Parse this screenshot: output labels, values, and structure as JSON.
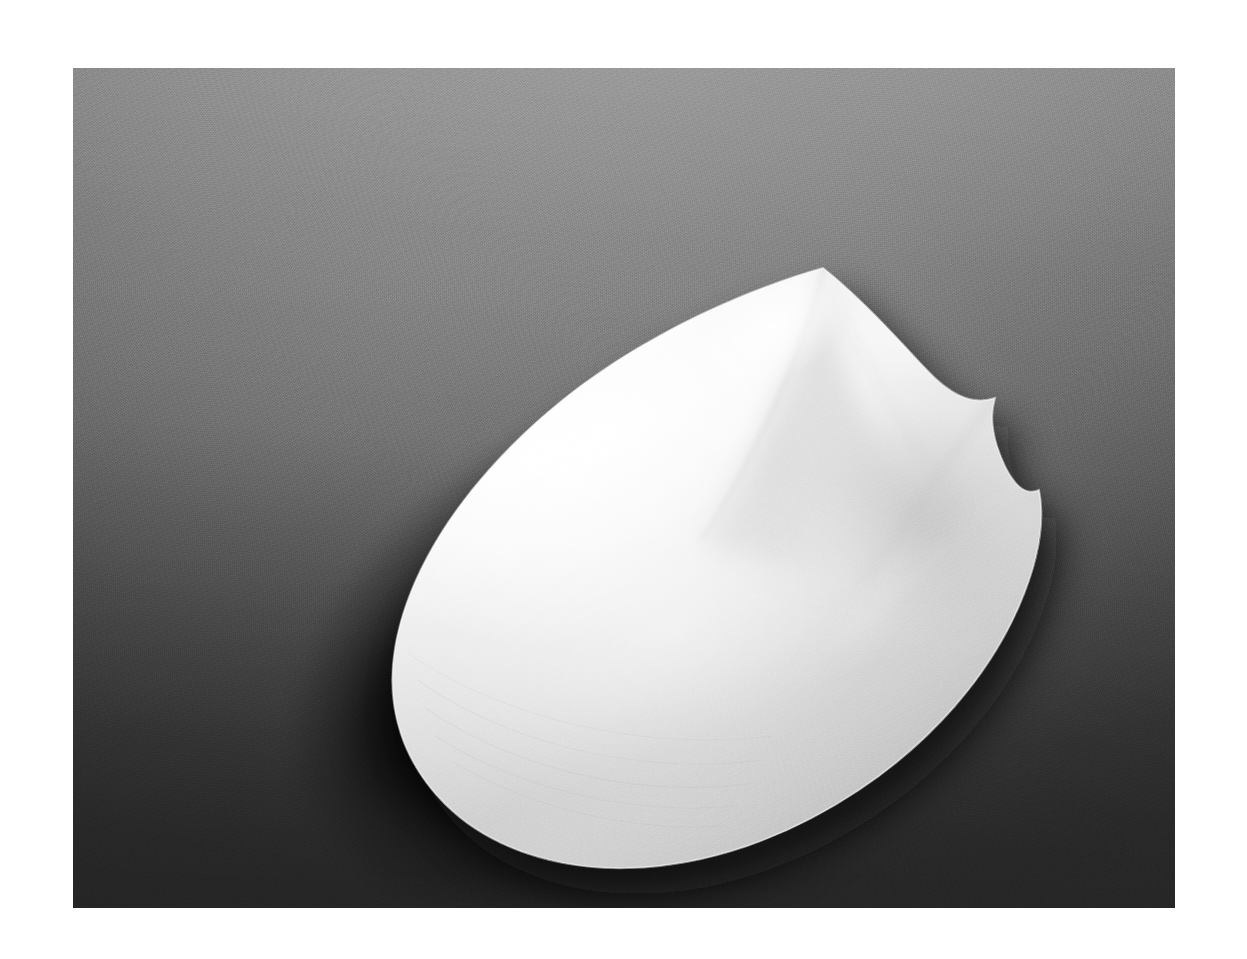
{
  "image": {
    "kind": "photograph",
    "medium": "black-and-white photograph",
    "subject": "white sculptural form",
    "subject_description": "Smooth white ovoid sculpture with a pointed apex and a folded ridge, resting on a gray studio sweep",
    "orientation": "landscape",
    "alt_text": "Black and white photograph of a smooth white egg-shaped sculpture with a pointed peak, lit from the upper left, casting a dark shadow on a gray gradient background.",
    "canvas": {
      "width": 1247,
      "height": 959
    },
    "plate": {
      "left": 73,
      "top": 68,
      "width": 1102,
      "height": 840
    },
    "mount_color": "#ffffff"
  },
  "palette": {
    "mount_white": "#ffffff",
    "background_light": "#9a9a9a",
    "background_mid": "#808080",
    "background_dark": "#3c3c3c",
    "background_darkest": "#2e2e2e",
    "object_highlight": "#ffffff",
    "object_light": "#f6f6f6",
    "object_midtone": "#e4e4e4",
    "object_shade": "#cfcfcf",
    "object_deep_shade": "#b4b4b4",
    "cast_shadow": "#121212"
  },
  "composition": {
    "light_direction": "upper-left",
    "apex_point": {
      "x": 750,
      "y": 200
    },
    "leftmost_point": {
      "x": 320,
      "y": 612
    },
    "rightmost_point": {
      "x": 966,
      "y": 422
    },
    "bottom_point": {
      "x": 560,
      "y": 800
    },
    "notch_point": {
      "x": 922,
      "y": 330
    },
    "object_tilt_degrees": -27
  },
  "shapes": {
    "body_path": "M 750 200 C 700 214 640 238 586 268 C 520 304 462 350 416 402 C 366 458 332 520 322 580 C 312 640 330 694 372 736 C 416 780 484 802 556 800 C 634 798 714 770 786 722 C 858 674 916 608 946 538 C 966 492 972 452 966 422 C 948 430 934 408 924 378 C 916 352 920 338 922 330 C 898 338 876 326 852 300 C 822 268 786 228 750 200 Z",
    "ridge_main_path": "M 750 200 C 738 248 714 312 686 368 C 662 416 640 452 628 470",
    "ridge_right_path": "M 750 200 C 772 250 800 312 836 366 C 866 412 898 452 922 476",
    "fold_path": "M 922 330 C 902 356 876 392 852 428 C 828 462 806 492 790 512",
    "fold_edge_path": "M 966 422 C 930 452 886 488 846 522 C 806 556 774 582 754 596",
    "lower_crease_path": "M 628 470 C 676 498 734 522 792 534 C 848 546 900 548 938 542"
  },
  "texture": {
    "grain": "film-grain",
    "surface": "matte-plaster",
    "background_surface": "paper-sweep"
  }
}
